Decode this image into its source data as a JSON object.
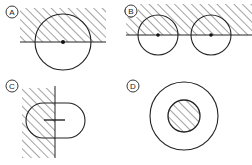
{
  "panels": [
    {
      "id": "A",
      "label": "A",
      "description": "circle centered on boundary line of hatched half-plane"
    },
    {
      "id": "B",
      "label": "B",
      "description": "two circles centered on boundary line of hatched band"
    },
    {
      "id": "C",
      "label": "C",
      "description": "stadium shape crossing vertical hatched region boundary with line segment"
    },
    {
      "id": "D",
      "label": "D",
      "description": "concentric circles with hatched inner disk"
    }
  ],
  "colors": {
    "stroke": "#222222",
    "background": "#ffffff"
  }
}
